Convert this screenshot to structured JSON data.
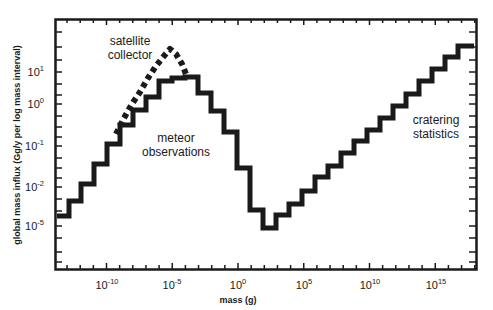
{
  "chart_data": {
    "type": "line",
    "style": "step histogram",
    "title": "",
    "xlabel": "mass (g)",
    "ylabel": "global mass influx (Gg/y per log mass interval)",
    "x_scale": "log",
    "y_scale": "log",
    "x_tick_labels": [
      {
        "base": "10",
        "exp": "-10"
      },
      {
        "base": "10",
        "exp": "-5"
      },
      {
        "base": "10",
        "exp": "0"
      },
      {
        "base": "10",
        "exp": "5"
      },
      {
        "base": "10",
        "exp": "10"
      },
      {
        "base": "10",
        "exp": "15"
      }
    ],
    "y_tick_labels": [
      {
        "base": "10",
        "exp": "1"
      },
      {
        "base": "10",
        "exp": "0"
      },
      {
        "base": "10",
        "exp": "-1"
      },
      {
        "base": "10",
        "exp": "-2"
      },
      {
        "base": "10",
        "exp": "-5"
      }
    ],
    "xlim_log10": [
      -14.1,
      18.0
    ],
    "grid": false,
    "legend": "none (inline annotations)",
    "series": [
      {
        "name": "meteor observations / cratering statistics (solid step line)",
        "style": "solid",
        "x_log10_bin_edges": [
          -14,
          -13,
          -12,
          -11,
          -10,
          -9,
          -8,
          -7,
          -6,
          -5,
          -4,
          -3,
          -2,
          -1,
          0,
          1,
          2,
          3,
          4,
          5,
          6,
          7,
          8,
          9,
          10,
          11,
          12,
          13,
          14,
          15,
          16,
          17,
          18
        ],
        "approx_log10_values": [
          -3.4,
          -2.7,
          -2.1,
          -1.4,
          -1.0,
          -0.5,
          -0.1,
          0.25,
          0.6,
          0.65,
          0.68,
          0.3,
          -0.1,
          -0.6,
          -1.5,
          -2.6,
          -3.1,
          -2.8,
          -2.5,
          -2.1,
          -1.8,
          -1.5,
          -1.2,
          -0.9,
          -0.6,
          -0.3,
          0.0,
          0.3,
          0.6,
          0.9,
          1.2,
          1.45
        ]
      },
      {
        "name": "satellite collector (dotted)",
        "style": "dotted",
        "x_log10": [
          -10.7,
          -9,
          -7,
          -5.4,
          -5
        ],
        "approx_log10_values": [
          -0.6,
          -0.1,
          0.7,
          1.4,
          0.7
        ]
      }
    ],
    "annotations": [
      {
        "text_lines": [
          "satellite",
          "collector"
        ]
      },
      {
        "text_lines": [
          "meteor",
          "observations"
        ]
      },
      {
        "text_lines": [
          "cratering",
          "statistics"
        ]
      }
    ]
  },
  "labels": {
    "xlabel": "mass (g)",
    "ylabel": "global mass influx (Gg/y per log mass interval)",
    "satellite_1": "satellite",
    "satellite_2": "collector",
    "meteor_1": "meteor",
    "meteor_2": "observations",
    "cratering_1": "cratering",
    "cratering_2": "statistics"
  },
  "colors": {
    "line": "#1a1a1a",
    "background": "#ffffff"
  }
}
